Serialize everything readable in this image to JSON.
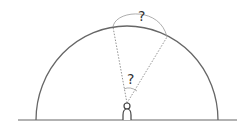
{
  "diagram": {
    "labels": {
      "top_angle": "?",
      "observer_angle": "?"
    },
    "colors": {
      "stroke": "#666666",
      "dotted": "#777777",
      "text": "#333333"
    }
  }
}
